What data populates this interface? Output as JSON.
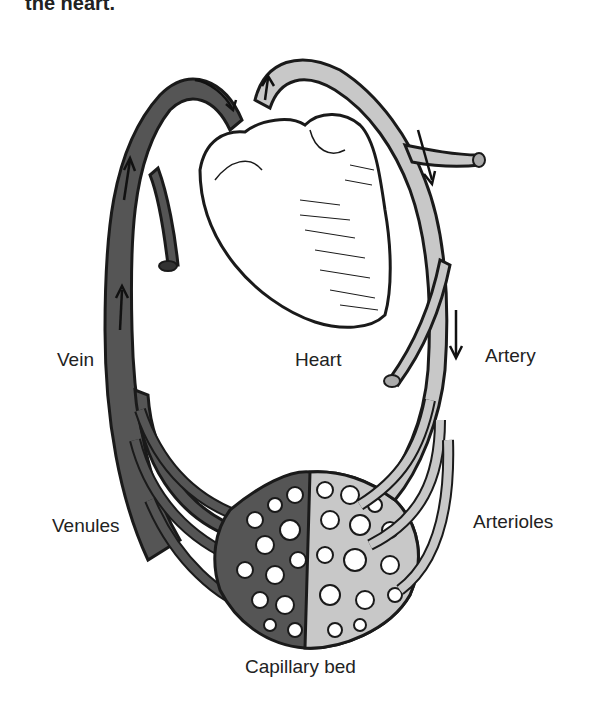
{
  "caption": {
    "partial_text": "the heart."
  },
  "labels": {
    "vein": "Vein",
    "heart": "Heart",
    "artery": "Artery",
    "venules": "Venules",
    "arterioles": "Arterioles",
    "capillary_bed": "Capillary bed"
  },
  "colors": {
    "vein": "#555555",
    "artery": "#c8c8c8",
    "outline": "#1a1a1a",
    "background": "#ffffff"
  }
}
